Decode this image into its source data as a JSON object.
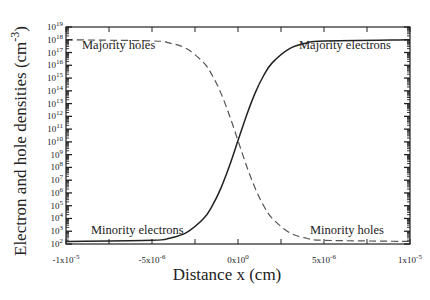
{
  "chart_data": {
    "type": "line",
    "title": "",
    "xlabel": "Distance x (cm)",
    "ylabel": "Electron and hole densities (cm^-3)",
    "ylabel_main": "Electron and hole densities (cm",
    "ylabel_exp": "-3",
    "ylabel_close": ")",
    "xlim": [
      -1e-05,
      1e-05
    ],
    "ylim": [
      100.0,
      1e+19
    ],
    "yscale": "log",
    "grid": false,
    "legend": "none (inline annotations)",
    "x_ticks": [
      {
        "value": -1e-05,
        "mant": "-1x10",
        "exp": "-5"
      },
      {
        "value": -5e-06,
        "mant": "-5x10",
        "exp": "-6"
      },
      {
        "value": 0,
        "mant": "0x10",
        "exp": "0"
      },
      {
        "value": 5e-06,
        "mant": "5x10",
        "exp": "-6"
      },
      {
        "value": 1e-05,
        "mant": "1x10",
        "exp": "-5"
      }
    ],
    "y_ticks": [
      19,
      18,
      17,
      16,
      15,
      14,
      13,
      12,
      11,
      10,
      9,
      8,
      7,
      6,
      5,
      4,
      3,
      2
    ],
    "x": [
      -1e-05,
      -5e-06,
      -4e-06,
      -3e-06,
      -2e-06,
      -1.5e-06,
      -1e-06,
      -5e-07,
      0,
      5e-07,
      1e-06,
      1.5e-06,
      2e-06,
      3e-06,
      4e-06,
      5e-06,
      1e-05
    ],
    "series": [
      {
        "name": "Electrons",
        "style": "solid",
        "color": "#222222",
        "log10_values": [
          2.2,
          2.29,
          2.45,
          2.89,
          3.99,
          4.98,
          6.36,
          8.11,
          10.1,
          12.09,
          13.84,
          15.22,
          16.21,
          17.31,
          17.75,
          17.91,
          18.0
        ]
      },
      {
        "name": "Holes",
        "style": "dashed",
        "color": "#555555",
        "log10_values": [
          18.0,
          17.91,
          17.75,
          17.31,
          16.21,
          15.22,
          13.84,
          12.09,
          10.1,
          8.11,
          6.36,
          4.98,
          3.99,
          2.89,
          2.45,
          2.29,
          2.2
        ]
      }
    ],
    "annotations": [
      {
        "text": "Majority holes",
        "x": 0.25,
        "y": 0.08
      },
      {
        "text": "Majority electrons",
        "x": 0.75,
        "y": 0.08
      },
      {
        "text": "Minority electrons",
        "x": 0.2,
        "y": 0.9
      },
      {
        "text": "Minority holes",
        "x": 0.82,
        "y": 0.9
      }
    ]
  },
  "labels": {
    "majority_holes": "Majority holes",
    "majority_electrons": "Majority electrons",
    "minority_electrons": "Minority electrons",
    "minority_holes": "Minority holes",
    "xlabel": "Distance x (cm)",
    "ylabel_main": "Electron and hole densities (cm",
    "ylabel_exp": "-3",
    "ylabel_close": ")"
  }
}
